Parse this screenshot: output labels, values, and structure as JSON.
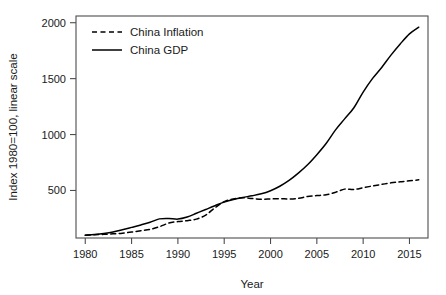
{
  "chart_data": {
    "type": "line",
    "title": "",
    "xlabel": "Year",
    "ylabel": "Index 1980=100, linear scale",
    "xlim": [
      1979,
      2017
    ],
    "ylim": [
      75,
      2060
    ],
    "grid": false,
    "legend_position": "top-left",
    "xticks": [
      1980,
      1985,
      1990,
      1995,
      2000,
      2005,
      2010,
      2015
    ],
    "yticks": [
      500,
      1000,
      1500,
      2000
    ],
    "x": [
      1980,
      1981,
      1982,
      1983,
      1984,
      1985,
      1986,
      1987,
      1988,
      1989,
      1990,
      1991,
      1992,
      1993,
      1994,
      1995,
      1996,
      1997,
      1998,
      1999,
      2000,
      2001,
      2002,
      2003,
      2004,
      2005,
      2006,
      2007,
      2008,
      2009,
      2010,
      2011,
      2012,
      2013,
      2014,
      2015,
      2016
    ],
    "series": [
      {
        "name": "China Inflation",
        "style": "dashed",
        "color": "#000000",
        "values": [
          100,
          104,
          108,
          112,
          118,
          128,
          140,
          152,
          176,
          208,
          222,
          230,
          244,
          280,
          345,
          400,
          425,
          435,
          428,
          422,
          424,
          427,
          424,
          429,
          446,
          454,
          461,
          483,
          512,
          508,
          525,
          540,
          554,
          568,
          578,
          586,
          595
        ]
      },
      {
        "name": "China GDP",
        "style": "solid",
        "color": "#000000",
        "values": [
          100,
          106,
          115,
          128,
          148,
          170,
          192,
          216,
          246,
          250,
          244,
          262,
          296,
          330,
          364,
          396,
          420,
          438,
          452,
          470,
          498,
          538,
          590,
          655,
          730,
          820,
          920,
          1040,
          1140,
          1240,
          1380,
          1500,
          1600,
          1710,
          1810,
          1900,
          1960
        ]
      }
    ]
  },
  "legend": {
    "entries": [
      {
        "label": "China Inflation"
      },
      {
        "label": "China GDP"
      }
    ]
  },
  "axes": {
    "x_title": "Year",
    "y_title": "Index 1980=100, linear scale"
  }
}
